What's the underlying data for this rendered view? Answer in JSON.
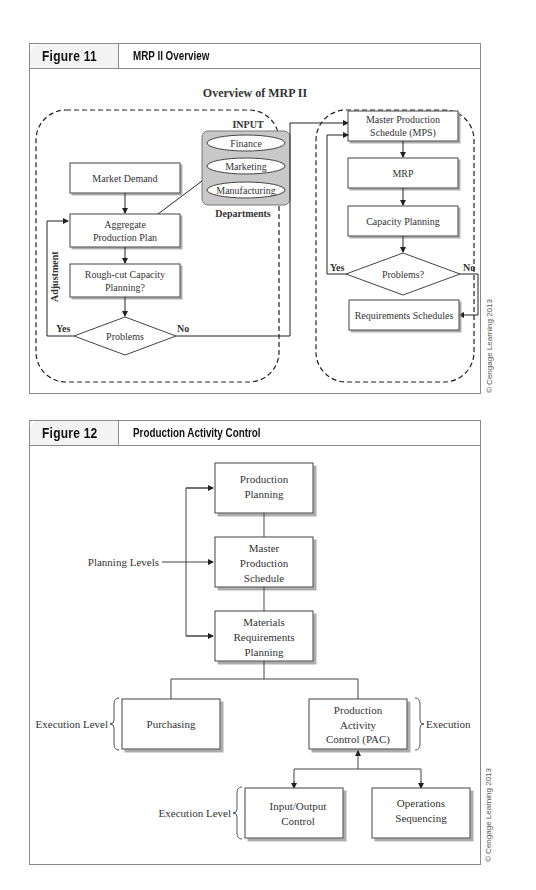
{
  "figure11": {
    "number": "Figure 11",
    "title": "MRP II Overview",
    "diagram_title": "Overview of MRP II",
    "input_label": "INPUT",
    "departments_label": "Departments",
    "departments": [
      "Finance",
      "Marketing",
      "Manufacturing"
    ],
    "left": {
      "market_demand": "Market Demand",
      "aggregate_line1": "Aggregate",
      "aggregate_line2": "Production Plan",
      "roughcut_line1": "Rough-cut Capacity",
      "roughcut_line2": "Planning?",
      "decision": "Problems",
      "yes": "Yes",
      "no": "No",
      "adjustment": "Adjustment"
    },
    "right": {
      "mps_line1": "Master Production",
      "mps_line2": "Schedule (MPS)",
      "mrp": "MRP",
      "capacity": "Capacity Planning",
      "decision": "Problems?",
      "yes": "Yes",
      "no": "No",
      "requirements": "Requirements Schedules"
    },
    "copyright": "© Cengage Learning 2013"
  },
  "figure12": {
    "number": "Figure 12",
    "title": "Production Activity Control",
    "production_planning": [
      "Production",
      "Planning"
    ],
    "mps": [
      "Master",
      "Production",
      "Schedule"
    ],
    "mrp": [
      "Materials",
      "Requirements",
      "Planning"
    ],
    "planning_levels": "Planning Levels",
    "purchasing": "Purchasing",
    "pac": [
      "Production",
      "Activity",
      "Control (PAC)"
    ],
    "execution_level_1": "Execution Level",
    "execution": "Execution",
    "io_control": [
      "Input/Output",
      "Control"
    ],
    "ops_sequencing": [
      "Operations",
      "Sequencing"
    ],
    "execution_level_2": "Execution Level",
    "copyright": "© Cengage Learning 2013"
  }
}
